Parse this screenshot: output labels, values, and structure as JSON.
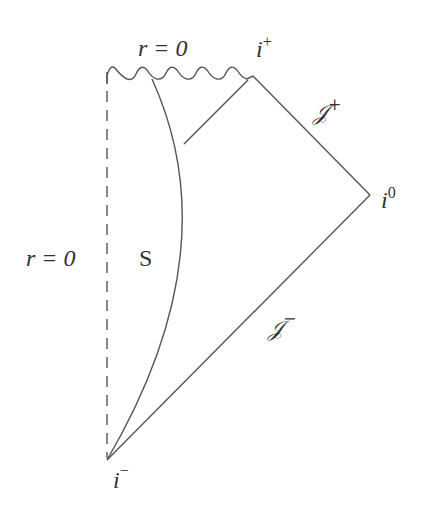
{
  "diagram": {
    "labels": {
      "r0_top": "r = 0",
      "r0_left": "r = 0",
      "i_plus": "i",
      "i_plus_sup": "+",
      "i_zero": "i",
      "i_zero_sup": "0",
      "i_minus": "i",
      "i_minus_sup": "−",
      "scri_plus": "𝒥",
      "scri_plus_sup": "+",
      "scri_minus": "𝒥",
      "scri_minus_sup": "−",
      "star_region": "S"
    },
    "colors": {
      "line": "#555555",
      "text": "#333333",
      "background": "#ffffff"
    },
    "vertices": {
      "i_minus": [
        107,
        460
      ],
      "i_zero": [
        370,
        195
      ],
      "i_plus": [
        253,
        76
      ],
      "top_left": [
        107,
        70
      ]
    }
  }
}
